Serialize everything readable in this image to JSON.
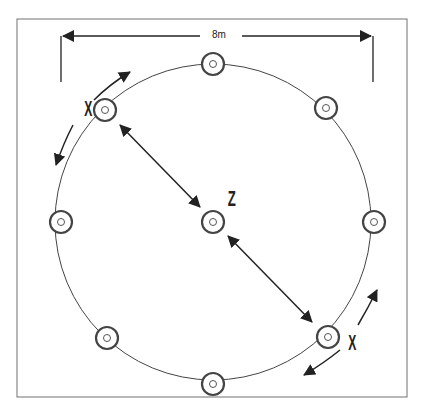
{
  "diagram": {
    "dimension_label": "8m",
    "center_label": "Z",
    "player_labels": [
      "X",
      "X"
    ],
    "colors": {
      "line": "#333333",
      "border": "#888888",
      "background": "#ffffff"
    },
    "circle": {
      "cx": 213,
      "cy": 222,
      "r": 158
    },
    "markers": [
      {
        "name": "marker-top",
        "x": 213,
        "y": 64
      },
      {
        "name": "marker-upper-right",
        "x": 326,
        "y": 108
      },
      {
        "name": "marker-right",
        "x": 374,
        "y": 222
      },
      {
        "name": "marker-lower-right",
        "x": 328,
        "y": 337
      },
      {
        "name": "marker-bottom",
        "x": 213,
        "y": 384
      },
      {
        "name": "marker-lower-left",
        "x": 107,
        "y": 338
      },
      {
        "name": "marker-left",
        "x": 61,
        "y": 222
      },
      {
        "name": "marker-upper-left",
        "x": 105,
        "y": 110
      },
      {
        "name": "marker-center",
        "x": 213,
        "y": 222
      }
    ]
  }
}
